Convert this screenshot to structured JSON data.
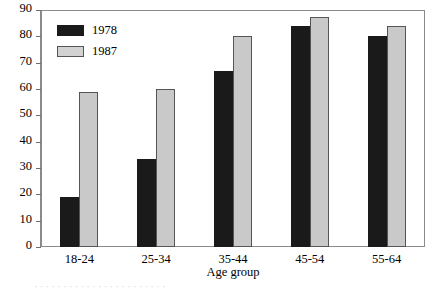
{
  "chart_data": {
    "type": "bar",
    "title": "",
    "xlabel": "Age group",
    "ylabel": "",
    "categories": [
      "18-24",
      "25-34",
      "35-44",
      "45-54",
      "55-64"
    ],
    "series": [
      {
        "name": "1978",
        "color": "#1a1a1a",
        "values": [
          19,
          33.5,
          67,
          84,
          80
        ]
      },
      {
        "name": "1987",
        "color": "#c9c9c9",
        "values": [
          59,
          60,
          80,
          87.5,
          84
        ]
      }
    ],
    "ylim": [
      0,
      90
    ],
    "ytick_step": 10,
    "yticks": [
      0,
      10,
      20,
      30,
      40,
      50,
      60,
      70,
      80,
      90
    ],
    "ytick_labels": [
      "0",
      "10",
      "20",
      "30",
      "40",
      "50",
      "60",
      "70",
      "80",
      "90"
    ],
    "grid": false,
    "legend_position": "top-left-inside",
    "frame": true
  },
  "legend": {
    "entries": [
      {
        "label": "1978"
      },
      {
        "label": "1987"
      }
    ]
  },
  "page_bleed": {
    "text": "·  ·  ·    ·  ·  ·  ·  ·  ·  ·  ·  ·    ·  ·  ·  ·  ·  ·  ·  ·  ·  ·  ·"
  }
}
